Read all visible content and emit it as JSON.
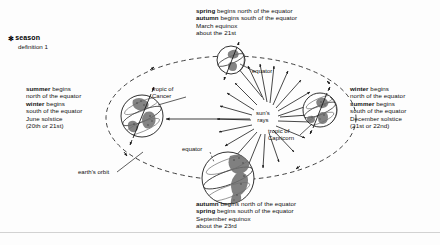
{
  "entry": {
    "star_glyph": "✻",
    "headword": "season",
    "definition_line": "definition 1"
  },
  "seasons": {
    "top": {
      "name": "march-equinox-block",
      "lines": [
        {
          "kw": "spring",
          "rest": " begins north of the equator"
        },
        {
          "kw": "autumn",
          "rest": " begins south of the equator"
        },
        {
          "kw": "",
          "rest": "March equinox"
        },
        {
          "kw": "",
          "rest": "about the 21st"
        }
      ]
    },
    "left": {
      "name": "june-solstice-block",
      "lines": [
        {
          "kw": "summer",
          "rest": " begins"
        },
        {
          "kw": "",
          "rest": "north of the equator"
        },
        {
          "kw": "winter",
          "rest": " begins"
        },
        {
          "kw": "",
          "rest": "south of the equator"
        },
        {
          "kw": "",
          "rest": "June solstice"
        },
        {
          "kw": "",
          "rest": "(20th or 21st)"
        }
      ]
    },
    "right": {
      "name": "december-solstice-block",
      "lines": [
        {
          "kw": "winter",
          "rest": " begins"
        },
        {
          "kw": "",
          "rest": "north of the equator"
        },
        {
          "kw": "summer",
          "rest": " begins"
        },
        {
          "kw": "",
          "rest": "south of the equator"
        },
        {
          "kw": "",
          "rest": "December solstice"
        },
        {
          "kw": "",
          "rest": "(21st or 22nd)"
        }
      ]
    },
    "bottom": {
      "name": "september-equinox-block",
      "lines": [
        {
          "kw": "autumn",
          "rest": " begins north of the equator"
        },
        {
          "kw": "spring",
          "rest": " begins south of the equator"
        },
        {
          "kw": "",
          "rest": "September equinox"
        },
        {
          "kw": "",
          "rest": "about the 23rd"
        }
      ]
    }
  },
  "diagram_labels": {
    "tropic_cancer": [
      "tropic of",
      "Cancer"
    ],
    "tropic_capricorn": [
      "tropic of",
      "Capricorn"
    ],
    "suns_rays": [
      "sun's",
      "rays"
    ],
    "equator_upper": "equator",
    "equator_lower": "equator",
    "earths_orbit": "earth's orbit"
  },
  "colors": {
    "ink": "#101010",
    "orbit": "#2a2a2a",
    "page": "#fdfdfd",
    "rule": "#d2d2d2"
  }
}
